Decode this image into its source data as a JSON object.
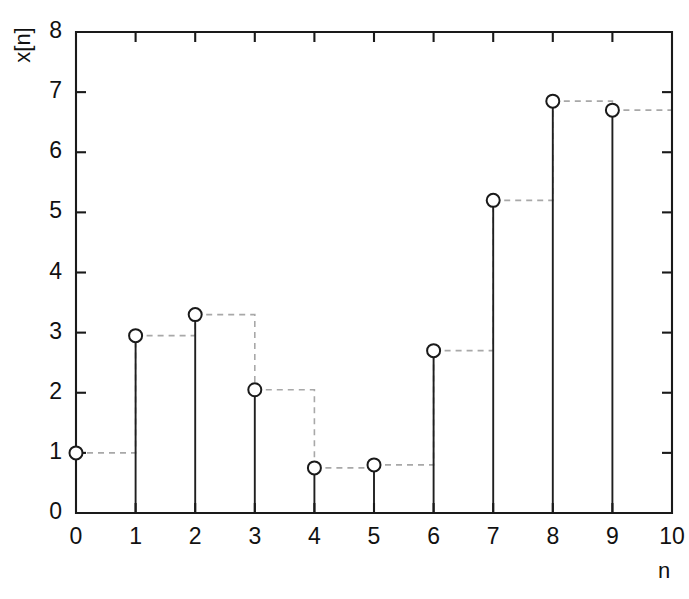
{
  "chart_data": {
    "type": "line",
    "title": "",
    "subtitle": "",
    "xlabel": "n",
    "ylabel": "x[n]",
    "xlim": [
      0,
      10
    ],
    "ylim": [
      0,
      8
    ],
    "grid": false,
    "legend": null,
    "x_ticks": [
      "0",
      "1",
      "2",
      "3",
      "4",
      "5",
      "6",
      "7",
      "8",
      "9",
      "10"
    ],
    "y_ticks": [
      "0",
      "1",
      "2",
      "3",
      "4",
      "5",
      "6",
      "7",
      "8"
    ],
    "x": [
      0,
      1,
      2,
      3,
      4,
      5,
      6,
      7,
      8,
      9
    ],
    "values": [
      1.0,
      2.95,
      3.3,
      2.05,
      0.75,
      0.8,
      2.7,
      5.2,
      6.85,
      6.7
    ],
    "series": [
      {
        "name": "x[n]",
        "values": [
          1.0,
          2.95,
          3.3,
          2.05,
          0.75,
          0.8,
          2.7,
          5.2,
          6.85,
          6.7
        ]
      }
    ],
    "marker": "open-circle",
    "stem_style": "solid",
    "hold_style": "dashed-staircase",
    "colors": {
      "axis": "#1a1a1a",
      "stem": "#1f1f1f",
      "marker_fill": "#ffffff",
      "marker_stroke": "#1a1a1a",
      "hold": "#a8a8a8",
      "background": "#ffffff"
    }
  }
}
